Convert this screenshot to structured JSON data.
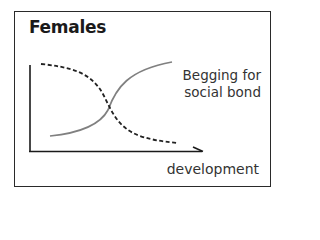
{
  "title": "Females",
  "curve_label_line1": "Begging for",
  "curve_label_line2": "social bond",
  "x_axis_label": "development",
  "colors": {
    "frame": "#2a2a2a",
    "axis": "#1a1a1a",
    "solid_curve": "#808080",
    "dashed_curve": "#222222"
  },
  "curves": [
    {
      "name": "Begging for social bond",
      "style": "solid",
      "trend": "increasing sigmoid"
    },
    {
      "name": "unlabeled",
      "style": "dashed",
      "trend": "decreasing sigmoid"
    }
  ]
}
